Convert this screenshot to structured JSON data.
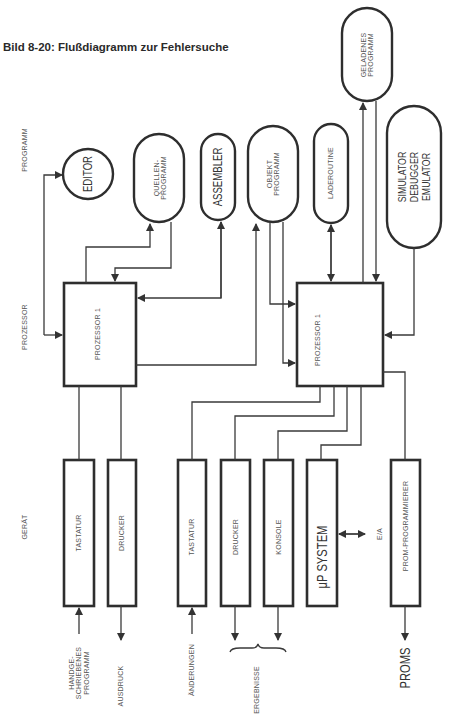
{
  "title": "Bild 8-20: Flußdiagramm zur Fehlersuche",
  "levels": {
    "program": "PROGRAMM",
    "processor": "PROZESSOR",
    "device": "GERÄT"
  },
  "nodes": {
    "editor": "EDITOR",
    "quellen_programm": "QUELLEN-\nPROGRAMM",
    "assembler": "ASSEMBLER",
    "objekt_programm": "OBJEKT\nPROGRAMM",
    "laderoutine": "LADEROUTINE",
    "geladenes_programm": "GELADENES\nPROGRAMM",
    "simulator": "SIMULATOR\nDEBUGGER\nEMULATOR",
    "prozessor_left": "PROZESSOR 1",
    "prozessor_right": "PROZESSOR 1",
    "tastatur_1": "TASTATUR",
    "drucker_1": "DRUCKER",
    "tastatur_2": "TASTATUR",
    "drucker_2": "DRUCKER",
    "konsole": "KONSOLE",
    "mp_system": "μP SYSTEM",
    "prom_programmierer": "PROM-PROGRAMMIERER"
  },
  "edge_labels": {
    "handgeschriebenes": "HANDGE-\nSCHRIEBENES\nPROGRAMM",
    "ausdruck": "AUSDRUCK",
    "aenderungen": "ÄNDERUNGEN",
    "ergebnisse": "ERGEBNISSE",
    "ea": "E/A",
    "proms": "PROMS"
  }
}
